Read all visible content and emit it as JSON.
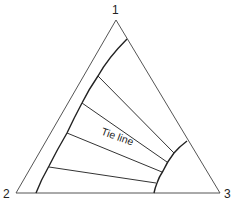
{
  "diagram": {
    "type": "ternary-phase-diagram",
    "vertices": [
      {
        "id": "1",
        "label": "1",
        "position": "top"
      },
      {
        "id": "2",
        "label": "2",
        "position": "bottom-left"
      },
      {
        "id": "3",
        "label": "3",
        "position": "bottom-right"
      }
    ],
    "annotation": "Tie line",
    "tie_line_count": 4,
    "colors": {
      "line": "#333333",
      "background": "#ffffff"
    }
  }
}
